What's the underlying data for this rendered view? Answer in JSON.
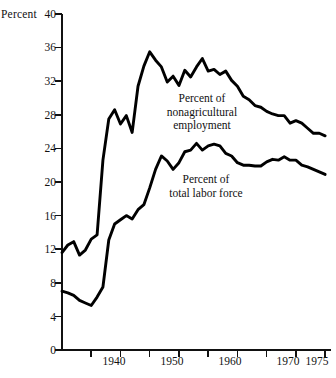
{
  "chart_data": {
    "type": "line",
    "title": "",
    "xlabel": "",
    "ylabel": "Percent",
    "xlim": [
      1930,
      1976
    ],
    "ylim": [
      0,
      40
    ],
    "grid": false,
    "legend_position": "inline-annotations",
    "y_ticks": [
      0,
      4,
      8,
      12,
      16,
      20,
      24,
      28,
      32,
      36,
      40
    ],
    "y_tick_labels": [
      "0",
      "4",
      "8",
      "12",
      "16",
      "20",
      "24",
      "28",
      "32",
      "36",
      "40"
    ],
    "x_ticks": [
      1935,
      1940,
      1945,
      1950,
      1955,
      1960,
      1965,
      1970,
      1975
    ],
    "x_tick_labels": [
      "",
      "1940",
      "",
      "1950",
      "",
      "1960",
      "",
      "1970",
      "1975"
    ],
    "annotations": [
      {
        "name": "nonagricultural-employment-label",
        "lines": [
          "Percent of",
          "nonagricultural",
          "employment"
        ],
        "text": "Percent of nonagricultural employment"
      },
      {
        "name": "total-labor-force-label",
        "lines": [
          "Percent of",
          "total labor force"
        ],
        "text": "Percent of total labor force"
      }
    ],
    "x": [
      1930,
      1931,
      1932,
      1933,
      1934,
      1935,
      1936,
      1937,
      1938,
      1939,
      1940,
      1941,
      1942,
      1943,
      1944,
      1945,
      1946,
      1947,
      1948,
      1949,
      1950,
      1951,
      1952,
      1953,
      1954,
      1955,
      1956,
      1957,
      1958,
      1959,
      1960,
      1961,
      1962,
      1963,
      1964,
      1965,
      1966,
      1967,
      1968,
      1969,
      1970,
      1971,
      1972,
      1973,
      1974,
      1975
    ],
    "series": [
      {
        "name": "Percent of nonagricultural employment",
        "color": "#000000",
        "values": [
          11.6,
          12.5,
          12.9,
          11.3,
          11.9,
          13.2,
          13.7,
          22.6,
          27.5,
          28.6,
          26.9,
          27.9,
          25.9,
          31.4,
          33.8,
          35.5,
          34.5,
          33.7,
          31.9,
          32.6,
          31.5,
          33.3,
          32.5,
          33.7,
          34.7,
          33.2,
          33.4,
          32.8,
          33.2,
          32.1,
          31.4,
          30.2,
          29.8,
          29.1,
          28.9,
          28.4,
          28.1,
          27.9,
          27.9,
          27.0,
          27.3,
          27.0,
          26.4,
          25.8,
          25.8,
          25.5
        ]
      },
      {
        "name": "Percent of total labor force",
        "color": "#000000",
        "values": [
          7.0,
          6.8,
          6.5,
          5.9,
          5.6,
          5.3,
          6.3,
          7.5,
          13.1,
          15.0,
          15.5,
          16.0,
          15.6,
          16.7,
          17.3,
          19.3,
          21.5,
          23.1,
          22.5,
          21.5,
          22.3,
          23.6,
          23.8,
          24.6,
          23.8,
          24.3,
          24.5,
          24.3,
          23.4,
          23.1,
          22.3,
          22.0,
          22.0,
          21.9,
          21.9,
          22.4,
          22.7,
          22.6,
          23.0,
          22.6,
          22.6,
          22.0,
          21.8,
          21.5,
          21.2,
          20.9
        ]
      }
    ]
  },
  "labels": {
    "y_axis_unit": "Percent",
    "y_40": "40",
    "y_36": "36",
    "y_32": "32",
    "y_28": "28",
    "y_24": "24",
    "y_20": "20",
    "y_16": "16",
    "y_12": "12",
    "y_8": "8",
    "y_4": "4",
    "y_0": "0",
    "x_1940": "1940",
    "x_1950": "1950",
    "x_1960": "1960",
    "x_1970": "1970",
    "x_1975": "1975"
  },
  "annotation_text": {
    "nonag_line1": "Percent of",
    "nonag_line2": "nonagricultural",
    "nonag_line3": "employment",
    "labor_line1": "Percent of",
    "labor_line2": "total labor force"
  }
}
